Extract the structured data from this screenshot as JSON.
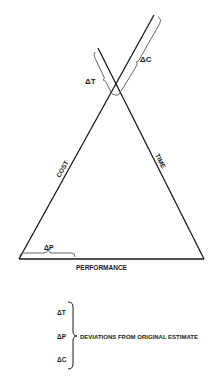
{
  "diagram": {
    "sides": {
      "left": "COST",
      "right": "TIME",
      "bottom": "PERFORMANCE"
    },
    "deviations": {
      "time": "ΔT",
      "cost": "ΔC",
      "performance": "ΔP"
    },
    "legend": {
      "items": [
        "ΔT",
        "ΔP",
        "ΔC"
      ],
      "description": "DEVIATIONS FROM ORIGINAL ESTIMATE"
    },
    "colors": {
      "line": "#1a1a1a",
      "background": "#ffffff"
    }
  }
}
